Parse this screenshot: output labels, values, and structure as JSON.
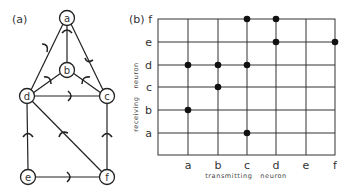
{
  "panel_a": {
    "label": "(a)",
    "nodes": [
      {
        "id": "a",
        "label": "a",
        "x": 67,
        "y": 18
      },
      {
        "id": "b",
        "label": "b",
        "x": 67,
        "y": 70
      },
      {
        "id": "c",
        "label": "c",
        "x": 107,
        "y": 96
      },
      {
        "id": "d",
        "label": "d",
        "x": 27,
        "y": 96
      },
      {
        "id": "e",
        "label": "e",
        "x": 28,
        "y": 177
      },
      {
        "id": "f",
        "label": "f",
        "x": 107,
        "y": 177
      }
    ],
    "edges": [
      {
        "from": "a",
        "to": "b"
      },
      {
        "from": "a",
        "to": "d"
      },
      {
        "from": "a",
        "to": "c"
      },
      {
        "from": "b",
        "to": "d"
      },
      {
        "from": "b",
        "to": "c"
      },
      {
        "from": "c",
        "to": "d"
      },
      {
        "from": "d",
        "to": "e"
      },
      {
        "from": "d",
        "to": "f"
      },
      {
        "from": "c",
        "to": "f"
      },
      {
        "from": "e",
        "to": "f"
      }
    ]
  },
  "panel_b": {
    "label": "(b)",
    "xlabel": "transmitting   neuron",
    "ylabel": "receiving   neuron",
    "columns": [
      "a",
      "b",
      "c",
      "d",
      "e",
      "f"
    ],
    "rows": [
      "f",
      "e",
      "d",
      "c",
      "b",
      "a"
    ],
    "connections": [
      {
        "transmitting": "a",
        "receiving": "d"
      },
      {
        "transmitting": "a",
        "receiving": "b"
      },
      {
        "transmitting": "b",
        "receiving": "d"
      },
      {
        "transmitting": "b",
        "receiving": "c"
      },
      {
        "transmitting": "c",
        "receiving": "f"
      },
      {
        "transmitting": "c",
        "receiving": "d"
      },
      {
        "transmitting": "c",
        "receiving": "a"
      },
      {
        "transmitting": "d",
        "receiving": "f"
      },
      {
        "transmitting": "d",
        "receiving": "e"
      },
      {
        "transmitting": "f",
        "receiving": "e"
      }
    ]
  }
}
